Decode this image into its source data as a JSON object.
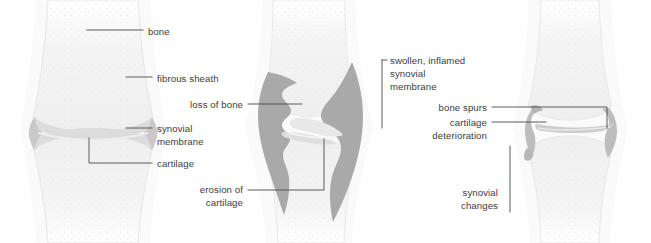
{
  "figure": {
    "background_color": "#ffffff",
    "text_color": "#3c3c3c",
    "leader_line_color": "#4a4a4a",
    "palette": {
      "bone_light": "#f1f1f1",
      "bone_edge": "#e4e4e4",
      "bone_shadow": "#dcdcdc",
      "cartilage": "#d9d9d9",
      "cartilage_edge": "#c6c6c6",
      "synovium_normal": "#cfcfcf",
      "synovium_inflamed": "#a9a9a9",
      "halo": "#f6f6f6"
    }
  },
  "panels": [
    {
      "id": "normal-joint",
      "name": "normal joint",
      "labels": [
        {
          "id": "bone",
          "text": "bone",
          "align": "left",
          "x": 148,
          "y": 25
        },
        {
          "id": "fibrous-sheath",
          "text": "fibrous sheath",
          "align": "left",
          "x": 157,
          "y": 72
        },
        {
          "id": "synovial-membrane",
          "text": "synovial\nmembrane",
          "align": "left",
          "x": 157,
          "y": 122
        },
        {
          "id": "cartilage",
          "text": "cartilage",
          "align": "left",
          "x": 157,
          "y": 157
        }
      ]
    },
    {
      "id": "rheumatoid-joint",
      "name": "rheumatoid arthritis joint",
      "labels": [
        {
          "id": "loss-of-bone",
          "text": "loss of bone",
          "align": "right",
          "x": 243,
          "y": 98
        },
        {
          "id": "erosion-of-cartilage",
          "text": "erosion of\ncartilage",
          "align": "right",
          "x": 243,
          "y": 183
        },
        {
          "id": "swollen-inflamed-synovial-membrane",
          "text": "swollen, inflamed\nsynovial\nmembrane",
          "align": "left",
          "x": 390,
          "y": 54
        }
      ]
    },
    {
      "id": "osteoarthritis-joint",
      "name": "osteoarthritis joint",
      "labels": [
        {
          "id": "bone-spurs",
          "text": "bone spurs",
          "align": "right",
          "x": 487,
          "y": 101
        },
        {
          "id": "cartilage-deterioration",
          "text": "cartilage\ndeterioration",
          "align": "right",
          "x": 487,
          "y": 116
        },
        {
          "id": "synovial-changes",
          "text": "synovial\nchanges",
          "align": "right",
          "x": 498,
          "y": 186
        }
      ]
    }
  ]
}
